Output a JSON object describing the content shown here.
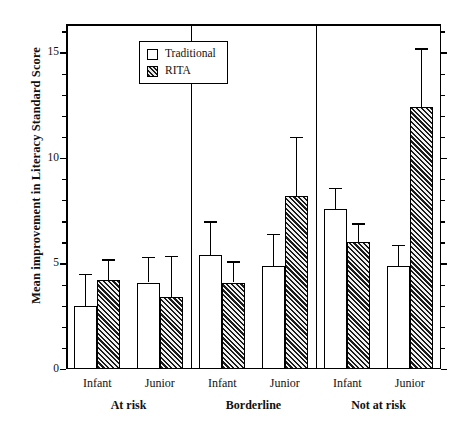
{
  "chart_data": {
    "type": "bar",
    "title": "",
    "xlabel": "",
    "ylabel": "Mean improvement in Literacy Standard Score",
    "ylim": [
      0,
      16.35
    ],
    "ytick_major": [
      0,
      5,
      10,
      15
    ],
    "ytick_minor_step": 1,
    "grid": false,
    "legend_position": "top-left",
    "legend": [
      "Traditional",
      "RITA"
    ],
    "groups": [
      "At risk",
      "Borderline",
      "Not at risk"
    ],
    "subgroups": [
      "Infant",
      "Junior"
    ],
    "categories": [
      "At risk / Infant",
      "At risk / Junior",
      "Borderline / Infant",
      "Borderline / Junior",
      "Not at risk / Infant",
      "Not at risk / Junior"
    ],
    "series": [
      {
        "name": "Traditional",
        "values": [
          3.0,
          4.1,
          5.4,
          4.9,
          7.6,
          4.9
        ],
        "errors_upper": [
          4.5,
          5.3,
          7.0,
          6.4,
          8.6,
          5.9
        ]
      },
      {
        "name": "RITA",
        "values": [
          4.2,
          3.4,
          4.1,
          8.2,
          6.0,
          12.4
        ],
        "errors_upper": [
          5.2,
          5.35,
          5.1,
          11.0,
          6.9,
          15.2
        ]
      }
    ]
  },
  "legend": {
    "traditional_label": "Traditional",
    "rita_label": "RITA"
  },
  "axis": {
    "ylabel": "Mean improvement in Literacy Standard Score",
    "tick_0": "0",
    "tick_5": "5",
    "tick_10": "10",
    "tick_15": "15"
  },
  "xaxis": {
    "groups": [
      {
        "label": "At risk",
        "subgroups": [
          "Infant",
          "Junior"
        ]
      },
      {
        "label": "Borderline",
        "subgroups": [
          "Infant",
          "Junior"
        ]
      },
      {
        "label": "Not at risk",
        "subgroups": [
          "Infant",
          "Junior"
        ]
      }
    ]
  },
  "colors": {
    "axis": "#000000",
    "traditional_fill": "#ffffff",
    "rita_fill": "#1b1b1b",
    "background": "#ffffff"
  }
}
